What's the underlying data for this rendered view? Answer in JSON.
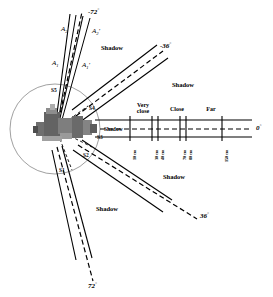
{
  "figure": {
    "type": "sensor-coverage-diagram"
  },
  "colors": {
    "line": "#000000",
    "circle": "#555555",
    "robot_dark": "#4a4a4a",
    "robot_mid": "#777777",
    "robot_light": "#a8a8a8",
    "background": "#ffffff"
  },
  "angles": [
    {
      "id": "a-minus72",
      "label": "-72",
      "degree_symbol": "°",
      "x": 88,
      "y": 10,
      "value": -72
    },
    {
      "id": "a-minus36",
      "label": "-36",
      "degree_symbol": "°",
      "x": 160,
      "y": 44,
      "value": -36
    },
    {
      "id": "a-zero",
      "label": "0",
      "degree_symbol": "°",
      "x": 256,
      "y": 131,
      "value": 0
    },
    {
      "id": "a-plus36",
      "label": "36",
      "degree_symbol": "°",
      "x": 200,
      "y": 215,
      "value": 36
    },
    {
      "id": "a-plus72",
      "label": "72",
      "degree_symbol": "°",
      "x": 90,
      "y": 285,
      "value": 72
    }
  ],
  "sensors": [
    {
      "id": "S1",
      "label": "S1",
      "x": 60,
      "y": 170,
      "angle": 72
    },
    {
      "id": "S2",
      "label": "S2",
      "x": 84,
      "y": 155,
      "angle": 36
    },
    {
      "id": "S3",
      "label": "S3",
      "x": 98,
      "y": 137,
      "angle": 0
    },
    {
      "id": "S4",
      "label": "S4",
      "x": 90,
      "y": 108,
      "angle": -36
    },
    {
      "id": "S5",
      "label": "S5",
      "x": 52,
      "y": 90,
      "angle": -72
    }
  ],
  "shadows": [
    {
      "id": "shadow-upper-left",
      "label": "Shadow",
      "x": 101,
      "y": 47
    },
    {
      "id": "shadow-upper-right",
      "label": "Shadow",
      "x": 172,
      "y": 84
    },
    {
      "id": "shadow-axis",
      "label": "Shadow",
      "x": 107,
      "y": 131
    },
    {
      "id": "shadow-lower-right",
      "label": "Shadow",
      "x": 163,
      "y": 176
    },
    {
      "id": "shadow-lower-left",
      "label": "Shadow",
      "x": 98,
      "y": 208
    }
  ],
  "beam_labels": [
    {
      "id": "A1",
      "base": "A",
      "sub": "1",
      "prime": "",
      "x": 52,
      "y": 63
    },
    {
      "id": "A2",
      "base": "A",
      "sub": "2",
      "prime": "",
      "x": 62,
      "y": 28
    },
    {
      "id": "A1p",
      "base": "A",
      "sub": "1",
      "prime": "'",
      "x": 84,
      "y": 65
    },
    {
      "id": "A2p",
      "base": "A",
      "sub": "2",
      "prime": "'",
      "x": 94,
      "y": 30
    }
  ],
  "zones": [
    {
      "id": "zone-very-close",
      "line1": "Very",
      "line2": "close",
      "x": 141,
      "y": 106
    },
    {
      "id": "zone-close",
      "line1": "Close",
      "line2": "",
      "x": 176,
      "y": 109
    },
    {
      "id": "zone-far",
      "line1": "Far",
      "line2": "",
      "x": 210,
      "y": 109
    }
  ],
  "axis": {
    "start_x": 108,
    "end_x": 252,
    "y": 128,
    "ticks": [
      {
        "x": 130,
        "label": "10 cm"
      },
      {
        "x": 152,
        "label": "30 cm"
      },
      {
        "x": 158,
        "label": "40 cm"
      },
      {
        "x": 180,
        "label": "70 cm"
      },
      {
        "x": 186,
        "label": "80 cm"
      },
      {
        "x": 222,
        "label": "150 cm"
      }
    ]
  },
  "geometry": {
    "center_x": 55,
    "center_y": 129,
    "circle_radius": 45,
    "beam_half_width_deg": 7.5,
    "beam_length": 175
  }
}
